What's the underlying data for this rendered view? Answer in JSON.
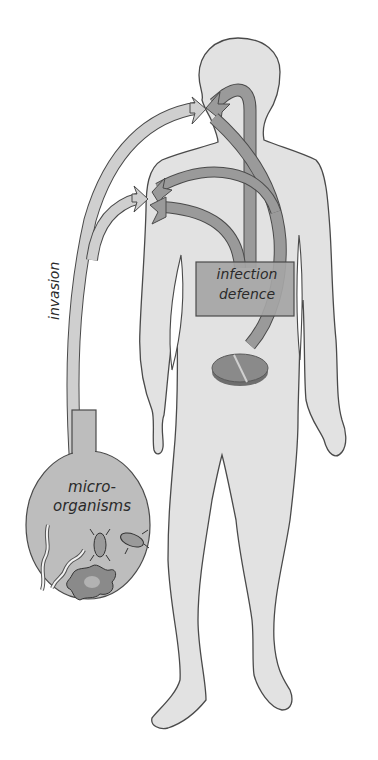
{
  "diagram": {
    "labels": {
      "invasion": "invasion",
      "infection_line1": "infection",
      "infection_line2": "defence",
      "micro_line1": "micro-",
      "micro_line2": "organisms"
    },
    "nodes": [
      {
        "id": "microorganisms",
        "shape": "oval",
        "items": [
          "worm",
          "worm",
          "bacterium",
          "bacterium",
          "amoeba"
        ]
      },
      {
        "id": "infection-defence",
        "shape": "box"
      },
      {
        "id": "tablet",
        "shape": "split-pill"
      },
      {
        "id": "human-body",
        "shape": "silhouette"
      }
    ],
    "arrows": [
      {
        "from": "microorganisms",
        "to": "mouth",
        "style": "light"
      },
      {
        "from": "microorganisms",
        "to": "chest",
        "style": "light"
      },
      {
        "from": "infection-defence",
        "to": "mouth",
        "style": "dark"
      },
      {
        "from": "infection-defence",
        "to": "chest",
        "style": "dark"
      },
      {
        "from": "tablet",
        "to": "mouth",
        "style": "dark"
      }
    ],
    "colors": {
      "background": "#ffffff",
      "body_fill": "#e2e2e2",
      "outline": "#4a4a4a",
      "light_arrow": "#cfcfcf",
      "dark_arrow": "#9a9a9a",
      "box_fill": "#a5a5a5",
      "oval_fill": "#bdbdbd",
      "tablet_fill": "#8a8a8a"
    }
  }
}
